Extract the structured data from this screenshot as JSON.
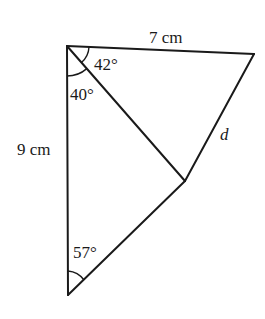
{
  "diagram": {
    "type": "geometry",
    "line_color": "#1a1a1a",
    "vertices": {
      "A": {
        "x": 67,
        "y": 46
      },
      "B": {
        "x": 254,
        "y": 54
      },
      "C": {
        "x": 185,
        "y": 181
      },
      "D": {
        "x": 68,
        "y": 295
      }
    },
    "segments": [
      {
        "from": "A",
        "to": "B",
        "label": "7 cm"
      },
      {
        "from": "A",
        "to": "D",
        "label": "9 cm"
      },
      {
        "from": "B",
        "to": "C",
        "label": "d"
      },
      {
        "from": "A",
        "to": "C",
        "label": ""
      },
      {
        "from": "C",
        "to": "D",
        "label": ""
      }
    ],
    "angles": [
      {
        "vertex": "A",
        "between": [
          "AB",
          "AC"
        ],
        "label": "42°"
      },
      {
        "vertex": "A",
        "between": [
          "AD",
          "AC"
        ],
        "label": "40°"
      },
      {
        "vertex": "D",
        "between": [
          "DA",
          "DC"
        ],
        "label": "57°"
      }
    ]
  },
  "labels": {
    "side_top": "7 cm",
    "side_left": "9 cm",
    "side_right": "d",
    "angle_top": "42°",
    "angle_upper_left": "40°",
    "angle_bottom": "57°"
  }
}
